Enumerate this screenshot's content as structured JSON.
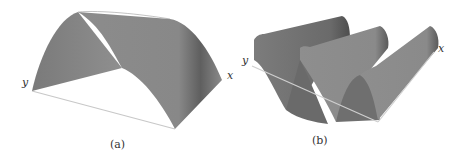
{
  "figures": [
    {
      "id": "a",
      "caption": "(a)",
      "axis_labels": {
        "x": "x",
        "y": "y"
      },
      "surface": "single half-sine arch over rectangle",
      "colors": {
        "surface_front": "#8a8a8a",
        "surface_back": "#7d7d7d",
        "shadow": "#5c5c5c",
        "axis": "#bdbdbd"
      }
    },
    {
      "id": "b",
      "caption": "(b)",
      "axis_labels": {
        "x": "x",
        "y": "y"
      },
      "surface": "sinusoidal waves (multiple arches) over rectangle",
      "colors": {
        "surface_front": "#8a8a8a",
        "surface_back": "#6e6e6e",
        "shadow": "#555555",
        "axis": "#bdbdbd"
      }
    }
  ]
}
